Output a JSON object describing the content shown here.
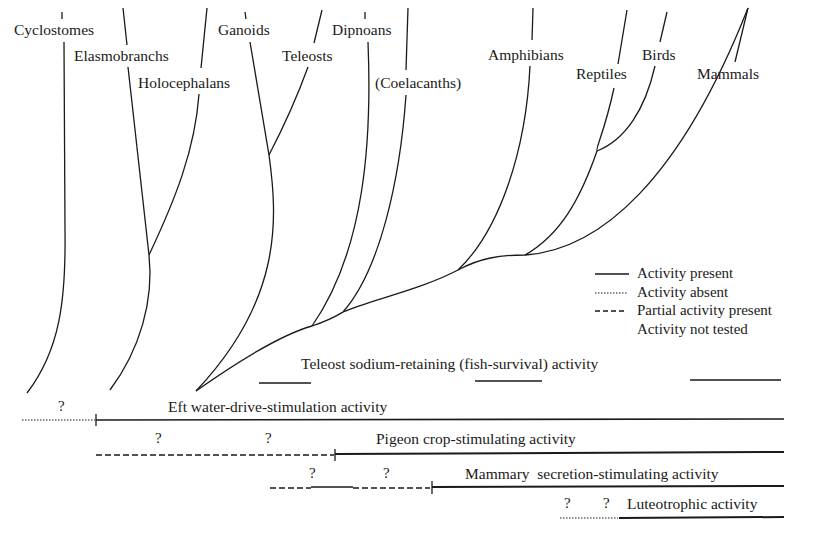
{
  "diagram": {
    "taxa": [
      {
        "id": "cyclostomes",
        "label": "Cyclostomes",
        "x": 14,
        "y": 22
      },
      {
        "id": "elasmobranchs",
        "label": "Elasmobranchs",
        "x": 74,
        "y": 47
      },
      {
        "id": "holocephalans",
        "label": "Holocephalans",
        "x": 138,
        "y": 74
      },
      {
        "id": "ganoids",
        "label": "Ganoids",
        "x": 218,
        "y": 22
      },
      {
        "id": "teleosts",
        "label": "Teleosts",
        "x": 282,
        "y": 47
      },
      {
        "id": "dipnoans",
        "label": "Dipnoans",
        "x": 332,
        "y": 22
      },
      {
        "id": "coelacanths",
        "label": "(Coelacanths)",
        "x": 375,
        "y": 74
      },
      {
        "id": "amphibians",
        "label": "Amphibians",
        "x": 488,
        "y": 47
      },
      {
        "id": "reptiles",
        "label": "Reptiles",
        "x": 576,
        "y": 66
      },
      {
        "id": "birds",
        "label": "Birds",
        "x": 642,
        "y": 47
      },
      {
        "id": "mammals",
        "label": "Mammals",
        "x": 697,
        "y": 66
      }
    ],
    "legend": {
      "items": [
        {
          "style": "solid",
          "label": "Activity present"
        },
        {
          "style": "dotted",
          "label": "Activity absent"
        },
        {
          "style": "dashed",
          "label": "Partial activity present"
        },
        {
          "style": "none",
          "label": "Activity not tested"
        }
      ]
    },
    "activities": [
      {
        "id": "teleost-sodium",
        "label": "Teleost sodium-retaining (fish-survival) activity"
      },
      {
        "id": "eft-water-drive",
        "label": "Eft water-drive-stimulation activity"
      },
      {
        "id": "pigeon-crop",
        "label": "Pigeon crop-stimulating activity"
      },
      {
        "id": "mammary-secretion",
        "label": "Mammary  secretion-stimulating activity"
      },
      {
        "id": "luteotrophic",
        "label": "Luteotrophic activity"
      }
    ],
    "question_mark": "?"
  }
}
